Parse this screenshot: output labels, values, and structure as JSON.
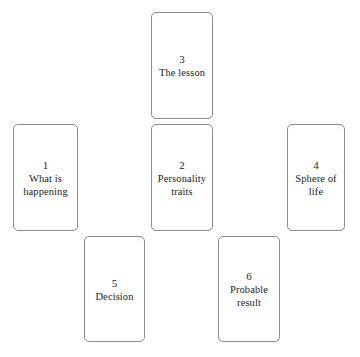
{
  "diagram": {
    "type": "tarot-spread-layout",
    "background_color": "#ffffff",
    "card_border_color": "#8c8c8c",
    "text_color": "#1b1b1b",
    "cards": [
      {
        "position": "3",
        "number": "3",
        "label": "The lesson",
        "slot": "top-center"
      },
      {
        "position": "1",
        "number": "1",
        "label": "What is\nhappening",
        "slot": "middle-left"
      },
      {
        "position": "2",
        "number": "2",
        "label": "Personality\ntraits",
        "slot": "middle-center"
      },
      {
        "position": "4",
        "number": "4",
        "label": "Sphere of\nlife",
        "slot": "middle-right"
      },
      {
        "position": "5",
        "number": "5",
        "label": "Decision",
        "slot": "bottom-left"
      },
      {
        "position": "6",
        "number": "6",
        "label": "Probable\nresult",
        "slot": "bottom-right"
      }
    ]
  }
}
